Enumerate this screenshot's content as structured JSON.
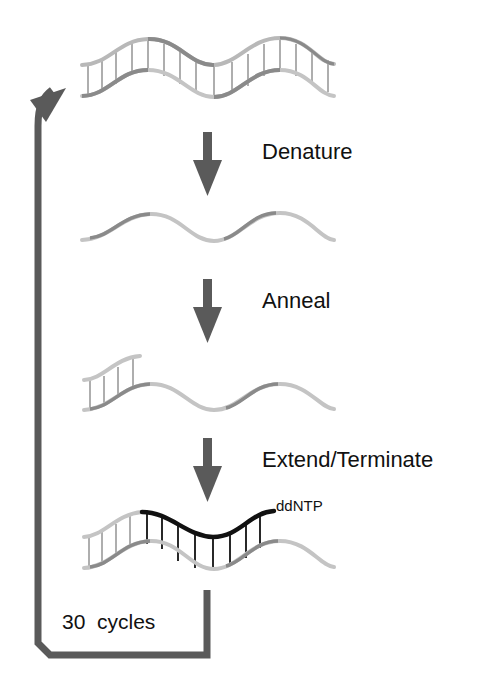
{
  "diagram": {
    "steps": [
      {
        "label": "Denature"
      },
      {
        "label": "Anneal"
      },
      {
        "label": "Extend/Terminate"
      }
    ],
    "annotations": {
      "terminator": "ddNTP",
      "cycles": "30  cycles"
    },
    "colors": {
      "arrow": "#5a5a5a",
      "strand_dark": "#8a8a8a",
      "strand_light": "#c4c4c4",
      "rung": "#9a9a9a",
      "new_strand": "#111111",
      "text": "#111111"
    }
  }
}
